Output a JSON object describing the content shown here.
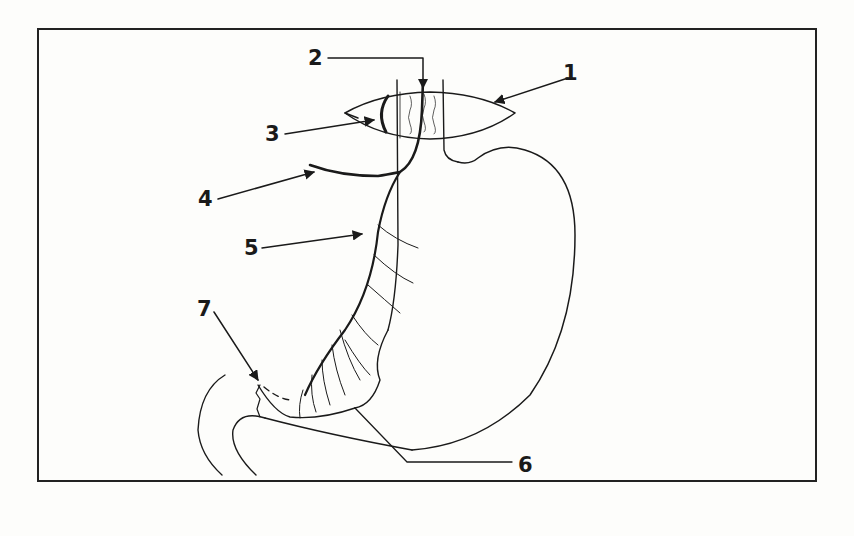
{
  "diagram": {
    "labels": [
      {
        "id": "1",
        "text": "1",
        "x": 563,
        "y": 63
      },
      {
        "id": "2",
        "text": "2",
        "x": 308,
        "y": 48
      },
      {
        "id": "3",
        "text": "3",
        "x": 265,
        "y": 126
      },
      {
        "id": "4",
        "text": "4",
        "x": 198,
        "y": 191
      },
      {
        "id": "5",
        "text": "5",
        "x": 244,
        "y": 240
      },
      {
        "id": "6",
        "text": "6",
        "x": 518,
        "y": 457
      },
      {
        "id": "7",
        "text": "7",
        "x": 197,
        "y": 301
      }
    ],
    "colors": {
      "ink": "#1a1a1a",
      "paper": "#fdfdfb"
    }
  }
}
